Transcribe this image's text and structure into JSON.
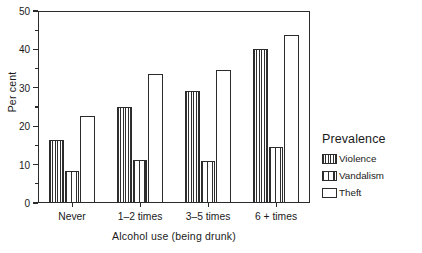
{
  "chart_data": {
    "type": "bar",
    "title": "",
    "xlabel": "Alcohol use (being drunk)",
    "ylabel": "Per cent",
    "categories": [
      "Never",
      "1–2 times",
      "3–5 times",
      "6 + times"
    ],
    "series": [
      {
        "name": "Violence",
        "values": [
          16.3,
          24.9,
          29.3,
          40.0
        ]
      },
      {
        "name": "Vandalism",
        "values": [
          8.3,
          11.2,
          11.0,
          14.5
        ]
      },
      {
        "name": "Theft",
        "values": [
          22.6,
          33.7,
          34.7,
          43.7
        ]
      }
    ],
    "ylim": [
      0,
      50
    ],
    "y_ticks_major": [
      0,
      10,
      20,
      30,
      40,
      50
    ],
    "y_tick_labels": [
      "0",
      "10",
      "20",
      "30",
      "40",
      "50"
    ],
    "y_ticks_minor": [
      5,
      15,
      25,
      35,
      45
    ],
    "grid": false,
    "legend_position": "right",
    "legend_title": "Prevalence",
    "patterns": [
      "dense-vertical-hatch",
      "sparse-vertical-lines",
      "empty"
    ]
  },
  "legend": {
    "title": "Prevalence",
    "entries": [
      {
        "label": "Violence",
        "swatch": "dense-vertical-hatch"
      },
      {
        "label": "Vandalism",
        "swatch": "sparse-vertical-lines"
      },
      {
        "label": "Theft",
        "swatch": "empty"
      }
    ]
  }
}
